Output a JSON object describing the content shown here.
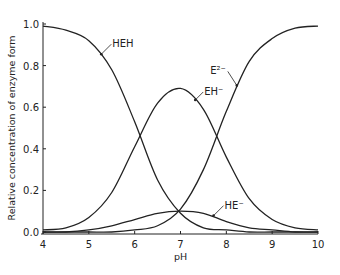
{
  "chart_data": {
    "type": "line",
    "title": "",
    "xlabel": "pH",
    "ylabel": "Relative concentration of enzyme form",
    "xlim": [
      4,
      10
    ],
    "ylim": [
      0,
      1.0
    ],
    "xticks": [
      "4",
      "5",
      "6",
      "7",
      "8",
      "9",
      "10"
    ],
    "yticks": [
      "0.0",
      "0.2",
      "0.4",
      "0.6",
      "0.8",
      "1.0"
    ],
    "grid": false,
    "legend": "none (inline curve labels with arrows)",
    "x": [
      4,
      4.5,
      5,
      5.5,
      6,
      6.5,
      7,
      7.5,
      8,
      8.5,
      9,
      9.5,
      10
    ],
    "series": [
      {
        "name": "HEH",
        "label": "HEH",
        "values": [
          0.99,
          0.97,
          0.92,
          0.78,
          0.53,
          0.25,
          0.09,
          0.02,
          0.01,
          0.0,
          0.0,
          0.0,
          0.0
        ]
      },
      {
        "name": "EH-",
        "label": "EH⁻",
        "values": [
          0.01,
          0.02,
          0.07,
          0.19,
          0.41,
          0.62,
          0.69,
          0.59,
          0.36,
          0.16,
          0.06,
          0.02,
          0.01
        ]
      },
      {
        "name": "HE-",
        "label": "HE⁻",
        "values": [
          0.0,
          0.0,
          0.01,
          0.03,
          0.06,
          0.09,
          0.1,
          0.09,
          0.05,
          0.02,
          0.01,
          0.0,
          0.0
        ]
      },
      {
        "name": "E2-",
        "label": "E²⁻",
        "values": [
          0.0,
          0.0,
          0.0,
          0.0,
          0.01,
          0.03,
          0.11,
          0.3,
          0.58,
          0.82,
          0.93,
          0.98,
          0.99
        ]
      }
    ],
    "annotations": [
      {
        "text": "HEH",
        "series": "HEH",
        "at_x": 5.25
      },
      {
        "text": "EH⁻",
        "series": "EH-",
        "at_x": 7.3
      },
      {
        "text": "E²⁻",
        "series": "E2-",
        "at_x": 8.25
      },
      {
        "text": "HE⁻",
        "series": "HE-",
        "at_x": 7.7
      }
    ],
    "line_color": "#222222"
  }
}
